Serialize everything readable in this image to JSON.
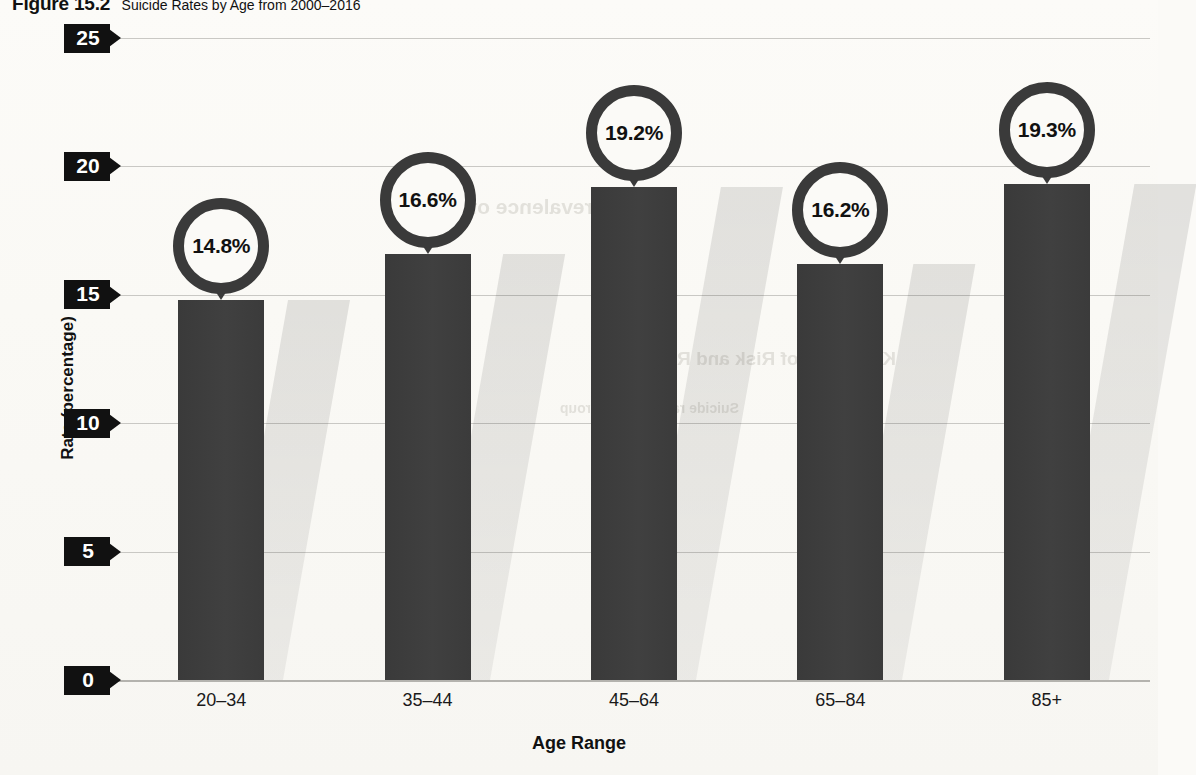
{
  "caption": {
    "figure_number": "Figure 15.2",
    "figure_title": "Suicide Rates by Age from 2000–2016"
  },
  "bleed_through": [
    {
      "text": "Prevalence of Risk",
      "x": 420,
      "y": 195,
      "size": 21
    },
    {
      "text": "Key Areas of Risk and Response",
      "x": 600,
      "y": 348,
      "size": 19
    },
    {
      "text": "Suicide rates by age group",
      "x": 560,
      "y": 400,
      "size": 14
    }
  ],
  "chart_data": {
    "type": "bar",
    "title": "Suicide Rates by Age from 2000–2016",
    "categories": [
      "20–34",
      "35–44",
      "45–64",
      "65–84",
      "85+"
    ],
    "values": [
      14.8,
      16.6,
      19.2,
      16.2,
      19.3
    ],
    "data_labels": [
      "14.8%",
      "16.6%",
      "19.2%",
      "16.2%",
      "19.3%"
    ],
    "xlabel": "Age Range",
    "ylabel": "Rate (percentage)",
    "ylim": [
      0,
      25
    ],
    "yticks": [
      0,
      5,
      10,
      15,
      20,
      25
    ],
    "ytick_labels": [
      "0",
      "5",
      "10",
      "15",
      "20",
      "25"
    ],
    "grid": true,
    "legend": false,
    "bar_color": "#3d3d3d",
    "label_ring_color": "#3a3a3a",
    "gridline_color": "#c9c8c4",
    "background_color": "#fbfaf7"
  }
}
